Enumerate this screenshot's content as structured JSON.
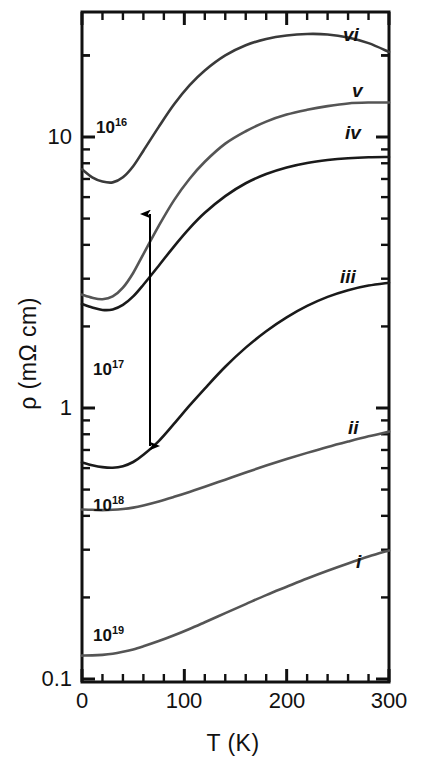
{
  "chart_data": {
    "type": "line",
    "title": "",
    "xlabel": "T (K)",
    "ylabel": "ρ (mΩ cm)",
    "xlim": [
      0,
      300
    ],
    "ylim": [
      0.1,
      31
    ],
    "yscale": "log",
    "xticks": [
      0,
      100,
      200,
      300
    ],
    "xtick_labels": [
      "0",
      "100",
      "200",
      "300"
    ],
    "yticks": [
      0.1,
      1,
      10
    ],
    "ytick_labels": [
      "0.1",
      "1",
      "10"
    ],
    "grid": false,
    "legend_position": "inline-right-of-curve",
    "annotations": [
      {
        "name": "density-1e16",
        "text": "10",
        "sup": "16",
        "x_px": 96,
        "y_px": 116
      },
      {
        "name": "density-1e17",
        "text": "10",
        "sup": "17",
        "x_px": 93,
        "y_px": 358
      },
      {
        "name": "density-1e18",
        "text": "10",
        "sup": "18",
        "x_px": 93,
        "y_px": 494
      },
      {
        "name": "density-1e19",
        "text": "10",
        "sup": "19",
        "x_px": 93,
        "y_px": 624
      },
      {
        "name": "double-arrow",
        "type": "double-headed-arrow",
        "x_px": 150,
        "y_top_px": 214,
        "y_bottom_px": 446
      }
    ],
    "series": [
      {
        "name": "i",
        "label": "i",
        "label_x_px": 356,
        "label_y_px": 551,
        "color": "#555555",
        "x": [
          0,
          10,
          20,
          30,
          40,
          50,
          60,
          75,
          90,
          105,
          120,
          140,
          160,
          180,
          200,
          220,
          240,
          260,
          280,
          300
        ],
        "y": [
          0.122,
          0.1222,
          0.1228,
          0.124,
          0.126,
          0.1285,
          0.132,
          0.138,
          0.145,
          0.153,
          0.162,
          0.175,
          0.189,
          0.204,
          0.219,
          0.235,
          0.251,
          0.267,
          0.283,
          0.298
        ]
      },
      {
        "name": "ii",
        "label": "ii",
        "label_x_px": 348,
        "label_y_px": 417,
        "color": "#555555",
        "x": [
          0,
          10,
          20,
          30,
          40,
          50,
          60,
          75,
          90,
          105,
          120,
          140,
          160,
          180,
          200,
          220,
          240,
          260,
          280,
          300
        ],
        "y": [
          0.422,
          0.421,
          0.42,
          0.421,
          0.424,
          0.429,
          0.437,
          0.452,
          0.47,
          0.49,
          0.512,
          0.544,
          0.578,
          0.613,
          0.648,
          0.683,
          0.718,
          0.752,
          0.786,
          0.818
        ]
      },
      {
        "name": "iii",
        "label": "iii",
        "label_x_px": 340,
        "label_y_px": 266,
        "color": "#1a1a1a",
        "x": [
          0,
          10,
          20,
          30,
          40,
          50,
          60,
          75,
          90,
          105,
          120,
          140,
          160,
          180,
          200,
          220,
          240,
          260,
          280,
          300
        ],
        "y": [
          0.63,
          0.615,
          0.605,
          0.602,
          0.61,
          0.632,
          0.672,
          0.755,
          0.875,
          1.02,
          1.18,
          1.42,
          1.67,
          1.92,
          2.16,
          2.38,
          2.57,
          2.72,
          2.83,
          2.9
        ]
      },
      {
        "name": "iv",
        "label": "iv",
        "label_x_px": 345,
        "label_y_px": 122,
        "color": "#1a1a1a",
        "x": [
          0,
          10,
          20,
          30,
          40,
          50,
          60,
          75,
          90,
          105,
          120,
          140,
          160,
          180,
          200,
          220,
          240,
          260,
          280,
          300
        ],
        "y": [
          2.42,
          2.35,
          2.3,
          2.31,
          2.4,
          2.58,
          2.85,
          3.35,
          3.95,
          4.6,
          5.25,
          6.05,
          6.75,
          7.3,
          7.72,
          8.02,
          8.22,
          8.35,
          8.42,
          8.44
        ]
      },
      {
        "name": "v",
        "label": "v",
        "label_x_px": 352,
        "label_y_px": 80,
        "color": "#555555",
        "x": [
          0,
          10,
          20,
          30,
          40,
          50,
          60,
          75,
          90,
          105,
          120,
          140,
          160,
          180,
          200,
          220,
          240,
          260,
          280,
          300
        ],
        "y": [
          2.62,
          2.55,
          2.52,
          2.58,
          2.78,
          3.15,
          3.7,
          4.7,
          5.85,
          7.0,
          8.1,
          9.45,
          10.5,
          11.4,
          12.1,
          12.6,
          13.0,
          13.3,
          13.4,
          13.4
        ]
      },
      {
        "name": "vi",
        "label": "vi",
        "label_x_px": 343,
        "label_y_px": 24,
        "color": "#3a3a3a",
        "x": [
          0,
          10,
          20,
          30,
          40,
          50,
          60,
          75,
          90,
          105,
          120,
          140,
          160,
          180,
          200,
          220,
          240,
          260,
          280,
          300
        ],
        "y": [
          7.6,
          7.1,
          6.85,
          6.8,
          7.1,
          7.8,
          8.9,
          10.9,
          13.2,
          15.5,
          17.6,
          20.0,
          21.8,
          23.0,
          23.7,
          24.0,
          23.9,
          23.3,
          22.2,
          20.6
        ]
      }
    ]
  },
  "axes": {
    "y_labels": [
      {
        "text": "10",
        "y_px": 137
      },
      {
        "text": "1",
        "y_px": 408
      },
      {
        "text": "0.1",
        "y_px": 679
      }
    ],
    "x_labels": [
      {
        "text": "0",
        "x_px": 82
      },
      {
        "text": "100",
        "x_px": 184
      },
      {
        "text": "200",
        "x_px": 287
      },
      {
        "text": "300",
        "x_px": 389
      }
    ],
    "xlabel": "T (K)",
    "ylabel": "ρ (mΩ cm)"
  }
}
